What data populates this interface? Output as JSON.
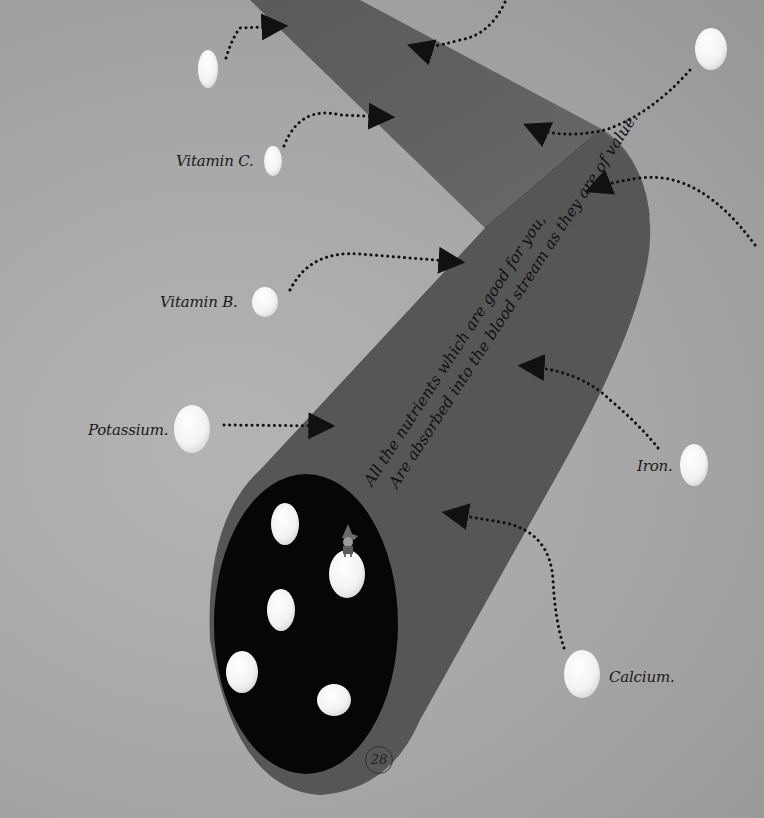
{
  "page": {
    "page_number": "28",
    "background_color": "#a8a8a8",
    "tube_color": "#595959",
    "tube_upper_color": "#616161",
    "opening_color": "#050505",
    "pill_color": "#f4f4f4"
  },
  "caption": {
    "line1": "All the nutrients which are good for you,",
    "line2": "Are absorbed into the blood stream as they are of value."
  },
  "nutrients": [
    {
      "id": "unlabeled-top-left",
      "label": ""
    },
    {
      "id": "unlabeled-top-right",
      "label": ""
    },
    {
      "id": "vitamin-c",
      "label": "Vitamin C."
    },
    {
      "id": "vitamin-b",
      "label": "Vitamin B."
    },
    {
      "id": "potassium",
      "label": "Potassium."
    },
    {
      "id": "iron",
      "label": "Iron."
    },
    {
      "id": "calcium",
      "label": "Calcium."
    }
  ],
  "arrows_count": 9,
  "opening_pills_count": 5,
  "character": "small-gnome-figure-standing-on-pill"
}
